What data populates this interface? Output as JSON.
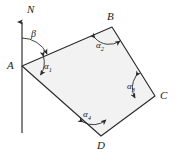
{
  "figure": {
    "type": "geometry-diagram",
    "colors": {
      "stroke": "#2b2b2b",
      "fill": "#f2f2f2",
      "background": "#ffffff",
      "text": "#1a1a1a"
    },
    "north_reference": {
      "label": "N",
      "arrow_direction": "up"
    },
    "bearing_angle": {
      "label": "β",
      "at_vertex": "A",
      "from": "north-line",
      "to": "edge-AB"
    },
    "vertices": [
      {
        "name": "A",
        "label": "A",
        "x": 22,
        "y": 66
      },
      {
        "name": "B",
        "label": "B",
        "x": 112,
        "y": 27
      },
      {
        "name": "C",
        "label": "C",
        "x": 155,
        "y": 96
      },
      {
        "name": "D",
        "label": "D",
        "x": 101,
        "y": 136
      }
    ],
    "interior_angles": [
      {
        "label": "α",
        "sub": "1",
        "at_vertex": "A",
        "x": 44,
        "y": 68
      },
      {
        "label": "α",
        "sub": "2",
        "at_vertex": "B",
        "x": 99,
        "y": 44
      },
      {
        "label": "α",
        "sub": "3",
        "at_vertex": "C",
        "x": 133,
        "y": 85
      },
      {
        "label": "α",
        "sub": "4",
        "at_vertex": "D",
        "x": 85,
        "y": 115
      }
    ]
  }
}
